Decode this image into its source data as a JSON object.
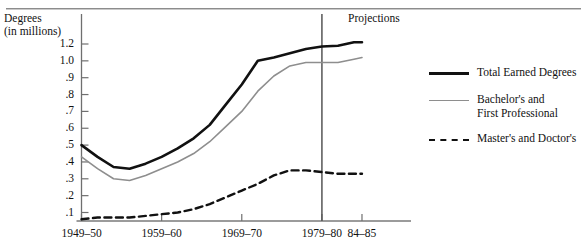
{
  "axis_title": {
    "line1": "Degrees",
    "line2": "(in millions)"
  },
  "annotations": {
    "projections": "Projections"
  },
  "legend": {
    "items": [
      {
        "label": "Total Earned Degrees",
        "style": "solid-thick",
        "color": "#111111"
      },
      {
        "label": "Bachelor's and\nFirst Professional",
        "style": "solid-thin",
        "color": "#8e8e8e"
      },
      {
        "label": "Master's and Doctor's",
        "style": "dashed",
        "color": "#111111"
      }
    ]
  },
  "chart_data": {
    "type": "line",
    "title": "",
    "xlabel": "",
    "ylabel": "Degrees (in millions)",
    "grid": false,
    "legend_position": "right",
    "ylim": [
      0,
      1.3
    ],
    "ytick_labels": [
      "1.2",
      "1.0",
      ".9",
      ".8",
      ".7",
      ".6",
      ".5",
      ".4",
      ".3",
      ".2",
      ".1"
    ],
    "ytick_values": [
      1.2,
      1.0,
      0.9,
      0.8,
      0.7,
      0.6,
      0.5,
      0.4,
      0.3,
      0.2,
      0.1
    ],
    "xtick_labels": [
      "1949–50",
      "1959–60",
      "1969–70",
      "1979–80",
      "84–85"
    ],
    "xtick_values": [
      1949,
      1959,
      1969,
      1979,
      1984
    ],
    "xlim": [
      1949,
      1985
    ],
    "projection_start": 1979,
    "series": [
      {
        "name": "Total Earned Degrees",
        "color": "#111111",
        "style": "solid",
        "width": 2.6,
        "x": [
          1949,
          1951,
          1953,
          1955,
          1957,
          1959,
          1961,
          1963,
          1965,
          1967,
          1969,
          1971,
          1973,
          1975,
          1977,
          1979,
          1981,
          1983,
          1984
        ],
        "y": [
          0.5,
          0.43,
          0.37,
          0.36,
          0.39,
          0.43,
          0.48,
          0.54,
          0.62,
          0.74,
          0.86,
          1.0,
          1.04,
          1.09,
          1.14,
          1.17,
          1.18,
          1.22,
          1.22
        ]
      },
      {
        "name": "Bachelor's and First Professional",
        "color": "#8e8e8e",
        "style": "solid",
        "width": 1.6,
        "x": [
          1949,
          1951,
          1953,
          1955,
          1957,
          1959,
          1961,
          1963,
          1965,
          1967,
          1969,
          1971,
          1973,
          1975,
          1977,
          1979,
          1981,
          1983,
          1984
        ],
        "y": [
          0.43,
          0.36,
          0.3,
          0.29,
          0.32,
          0.36,
          0.4,
          0.45,
          0.52,
          0.61,
          0.7,
          0.82,
          0.91,
          0.97,
          0.99,
          0.99,
          0.99,
          1.02,
          1.04
        ]
      },
      {
        "name": "Master's and Doctor's",
        "color": "#111111",
        "style": "dashed",
        "width": 2.4,
        "x": [
          1949,
          1951,
          1953,
          1955,
          1957,
          1959,
          1961,
          1963,
          1965,
          1967,
          1969,
          1971,
          1973,
          1975,
          1977,
          1979,
          1981,
          1983,
          1984
        ],
        "y": [
          0.06,
          0.07,
          0.07,
          0.07,
          0.08,
          0.09,
          0.1,
          0.12,
          0.15,
          0.19,
          0.23,
          0.27,
          0.32,
          0.35,
          0.35,
          0.34,
          0.33,
          0.33,
          0.33
        ]
      }
    ]
  }
}
